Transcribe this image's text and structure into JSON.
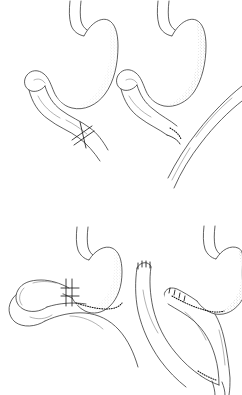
{
  "figure": {
    "background_color": "#ffffff",
    "ink_color": "#2b2b2b",
    "shading_style": "stipple",
    "width": 242,
    "height": 395,
    "caption": "",
    "panel_layout": "2x2 grid, no borders, no labels"
  },
  "panels": [
    {
      "id": "top-left",
      "name": "billroth-ii-loop-gastrojejunostomy",
      "position": "top-left",
      "label": "",
      "organs": [
        "stomach",
        "duodenum",
        "jejunum"
      ],
      "anastomosis": {
        "type": "crossed-suture-marker",
        "name": "crossed-suture-anastomosis",
        "description": "two crossed oblique suture lines across the efferent limb"
      }
    },
    {
      "id": "top-right",
      "name": "side-to-side-gastrojejunostomy",
      "position": "top-right",
      "label": "",
      "organs": [
        "stomach",
        "duodenum",
        "jejunum"
      ],
      "anastomosis": {
        "type": "stippled-suture-line",
        "name": "side-to-side-anastomosis",
        "description": "dotted suture line where jejunal loop meets gastric outlet"
      }
    },
    {
      "id": "bottom-left",
      "name": "loop-gastrojejunostomy-with-blind-limb",
      "position": "bottom-left",
      "label": "",
      "organs": [
        "stomach",
        "jejunum",
        "blind-loop"
      ],
      "anastomosis": {
        "type": "double-crossed-suture-and-staple-line",
        "name": "gastrojejunal-staple-line",
        "description": "double crossed suture bars plus dotted staple line along greater curvature"
      }
    },
    {
      "id": "bottom-right",
      "name": "roux-en-y-gastrojejunostomy",
      "position": "bottom-right",
      "label": "",
      "organs": [
        "stomach",
        "roux-limb",
        "biliopancreatic-limb"
      ],
      "anastomosis": {
        "type": "stapled-stump-and-y-junction",
        "name": "roux-en-y-anastomosis",
        "description": "closed stapled jejunal stump, gastrojejunal staple line and distal Y junction"
      }
    }
  ],
  "colors": {
    "background": "#ffffff",
    "ink": "#2b2b2b",
    "suture": "#111111",
    "shading": "#8a8a8a"
  }
}
